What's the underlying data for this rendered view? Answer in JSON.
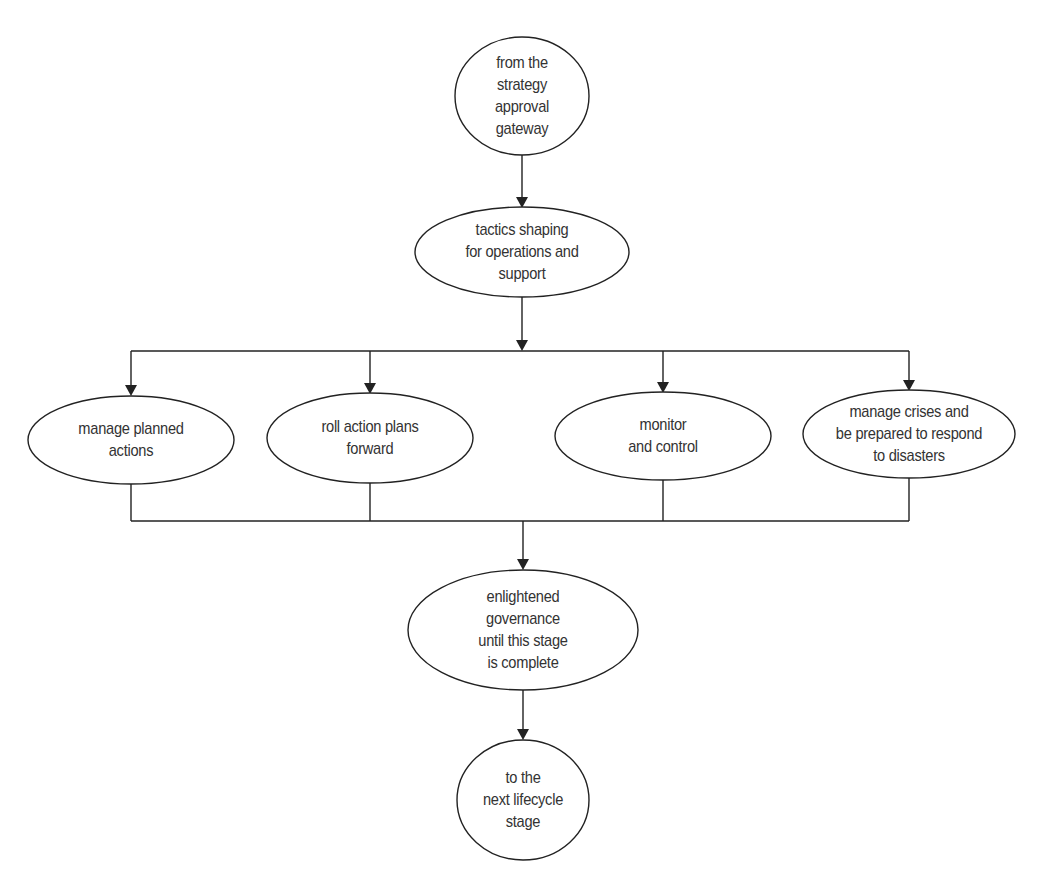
{
  "diagram": {
    "type": "flowchart",
    "colors": {
      "stroke": "#222222",
      "text": "#333333",
      "background": "#ffffff"
    },
    "nodes": [
      {
        "id": "start",
        "shape": "circle",
        "lines": [
          "from the",
          "strategy",
          "approval",
          "gateway"
        ]
      },
      {
        "id": "tactics",
        "shape": "ellipse",
        "lines": [
          "tactics shaping",
          "for operations and",
          "support"
        ]
      },
      {
        "id": "planned",
        "shape": "ellipse",
        "lines": [
          "manage planned",
          "actions"
        ]
      },
      {
        "id": "roll",
        "shape": "ellipse",
        "lines": [
          "roll action plans",
          "forward"
        ]
      },
      {
        "id": "monitor",
        "shape": "ellipse",
        "lines": [
          "monitor",
          "and control"
        ]
      },
      {
        "id": "crises",
        "shape": "ellipse",
        "lines": [
          "manage crises and",
          "be prepared to respond",
          "to disasters"
        ]
      },
      {
        "id": "governance",
        "shape": "ellipse",
        "lines": [
          "enlightened",
          "governance",
          "until this stage",
          "is complete"
        ]
      },
      {
        "id": "end",
        "shape": "circle",
        "lines": [
          "to the",
          "next lifecycle",
          "stage"
        ]
      }
    ],
    "edges": [
      {
        "from": "start",
        "to": "tactics"
      },
      {
        "from": "tactics",
        "to": "planned"
      },
      {
        "from": "tactics",
        "to": "roll"
      },
      {
        "from": "tactics",
        "to": "monitor"
      },
      {
        "from": "tactics",
        "to": "crises"
      },
      {
        "from": "planned",
        "to": "governance"
      },
      {
        "from": "roll",
        "to": "governance"
      },
      {
        "from": "monitor",
        "to": "governance"
      },
      {
        "from": "crises",
        "to": "governance"
      },
      {
        "from": "governance",
        "to": "end"
      }
    ]
  }
}
